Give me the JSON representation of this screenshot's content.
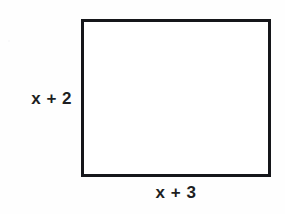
{
  "figure": {
    "type": "geometry-diagram",
    "shape": "rectangle",
    "background_color": "#fefefe",
    "stroke_color": "#15161a",
    "stroke_width_px": 3,
    "fill_color": "#ffffff",
    "text_color": "#1d1e22",
    "labels": {
      "height_label": "x + 2",
      "width_label": "x + 3"
    },
    "geometry": {
      "left_px": 81,
      "top_px": 19,
      "width_px": 190,
      "height_px": 158
    }
  }
}
